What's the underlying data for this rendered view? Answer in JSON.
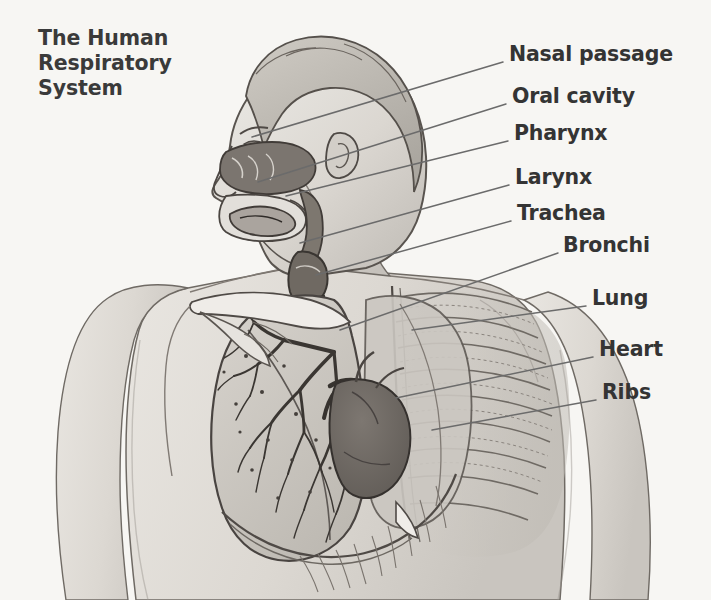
{
  "meta": {
    "domain": "Diagram",
    "width": 711,
    "height": 600,
    "background_color": "#f7f6f3",
    "style": "grayscale anatomical line illustration with leader-line callouts"
  },
  "title": {
    "text": "The Human\nRespiratory\nSystem",
    "lines": [
      "The Human",
      "Respiratory",
      "System"
    ],
    "color": "#3a3a3a"
  },
  "labels": [
    {
      "id": "nasal-passage",
      "text": "Nasal passage",
      "x": 509,
      "y": 43,
      "leader": {
        "x1": 503,
        "y1": 62,
        "x2": 252,
        "y2": 137
      }
    },
    {
      "id": "oral-cavity",
      "text": "Oral cavity",
      "x": 512,
      "y": 85,
      "leader": {
        "x1": 506,
        "y1": 104,
        "x2": 258,
        "y2": 182
      }
    },
    {
      "id": "pharynx",
      "text": "Pharynx",
      "x": 514,
      "y": 122,
      "leader": {
        "x1": 508,
        "y1": 141,
        "x2": 286,
        "y2": 196
      }
    },
    {
      "id": "larynx",
      "text": "Larynx",
      "x": 515,
      "y": 166,
      "leader": {
        "x1": 509,
        "y1": 185,
        "x2": 300,
        "y2": 243
      }
    },
    {
      "id": "trachea",
      "text": "Trachea",
      "x": 517,
      "y": 202,
      "leader": {
        "x1": 511,
        "y1": 221,
        "x2": 316,
        "y2": 275
      }
    },
    {
      "id": "bronchi",
      "text": "Bronchi",
      "x": 563,
      "y": 234,
      "leader": {
        "x1": 558,
        "y1": 253,
        "x2": 340,
        "y2": 330
      }
    },
    {
      "id": "lung",
      "text": "Lung",
      "x": 592,
      "y": 287,
      "leader": {
        "x1": 586,
        "y1": 306,
        "x2": 412,
        "y2": 330
      }
    },
    {
      "id": "heart",
      "text": "Heart",
      "x": 599,
      "y": 338,
      "leader": {
        "x1": 593,
        "y1": 357,
        "x2": 396,
        "y2": 398
      }
    },
    {
      "id": "ribs",
      "text": "Ribs",
      "x": 602,
      "y": 381,
      "leader": {
        "x1": 596,
        "y1": 400,
        "x2": 432,
        "y2": 430
      }
    }
  ],
  "figure": {
    "name": "human-upper-body-profile",
    "parts": [
      "head-profile",
      "nasal-cavity",
      "oral-cavity",
      "tongue",
      "pharynx",
      "larynx",
      "trachea",
      "left-lung",
      "bronchial-tree",
      "heart",
      "rib-cage",
      "diaphragm",
      "clavicle",
      "scapula",
      "shoulder",
      "neck",
      "torso"
    ]
  },
  "palette": {
    "ink": "#4a4a4a",
    "ink_dark": "#2f2f2f",
    "skin": "#dcd9d4",
    "skin_shade": "#c8c4be",
    "skin_light": "#e8e5e0",
    "cavity_dark": "#7a756f",
    "heart_dark": "#6e6862",
    "lung_fill": "#cfcbc5",
    "leader": "#6b6b6b"
  },
  "chart_data": {
    "type": "table",
    "title": "The Human Respiratory System",
    "categories": [
      "Nasal passage",
      "Oral cavity",
      "Pharynx",
      "Larynx",
      "Trachea",
      "Bronchi",
      "Lung",
      "Heart",
      "Ribs"
    ]
  }
}
